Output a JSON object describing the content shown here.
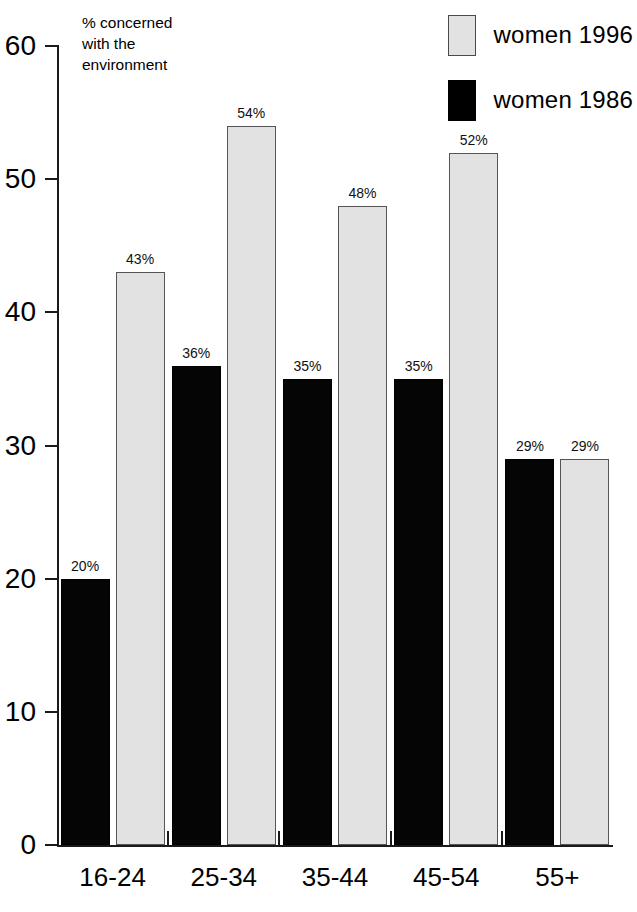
{
  "chart_data": {
    "type": "bar",
    "title": "",
    "subtitle": "",
    "xlabel": "",
    "ylabel": "% concerned with the environment",
    "ylabel_lines": [
      "% concerned",
      "with the",
      "environment"
    ],
    "categories": [
      "16-24",
      "25-34",
      "35-44",
      "45-54",
      "55+"
    ],
    "series": [
      {
        "name": "women 1986",
        "color": "#000000",
        "values": [
          20,
          36,
          35,
          35,
          29
        ],
        "labels": [
          "20%",
          "36%",
          "35%",
          "35%",
          "29%"
        ]
      },
      {
        "name": "women 1996",
        "color": "#e2e2e2",
        "values": [
          43,
          54,
          48,
          52,
          29
        ],
        "labels": [
          "43%",
          "54%",
          "48%",
          "52%",
          "29%"
        ]
      }
    ],
    "ylim": [
      0,
      60
    ],
    "yticks": [
      0,
      10,
      20,
      30,
      40,
      50,
      60
    ],
    "ytick_labels": [
      "0",
      "10",
      "20",
      "30",
      "40",
      "50",
      "60"
    ],
    "grid": false,
    "legend_position": "top-right",
    "legend_order": [
      "women 1996",
      "women 1986"
    ],
    "value_labels_shown": true
  },
  "legend": {
    "entries": [
      {
        "label": "women 1996",
        "swatch": "light-gray-square"
      },
      {
        "label": "women 1986",
        "swatch": "black-square"
      }
    ]
  },
  "axis_note": {
    "line1": "% concerned",
    "line2": "with the",
    "line3": "environment"
  }
}
